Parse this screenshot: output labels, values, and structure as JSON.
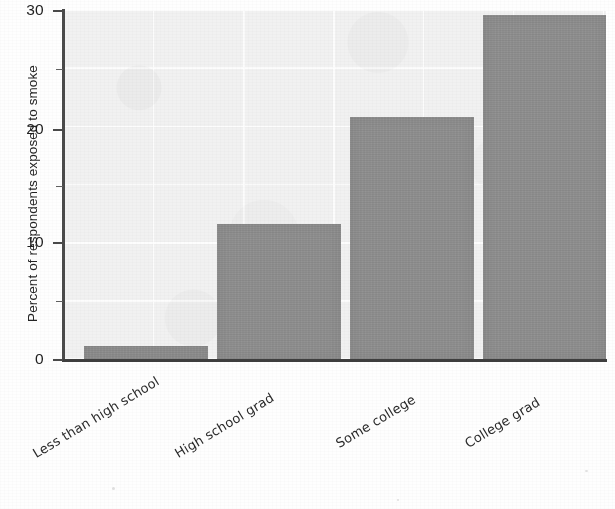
{
  "chart_data": {
    "type": "bar",
    "title": "",
    "xlabel": "",
    "ylabel": "Percent of respondents exposed to smoke",
    "categories": [
      "Less than high school",
      "High school grad",
      "Some college",
      "College grad"
    ],
    "values": [
      1.2,
      11.7,
      20.9,
      29.7
    ],
    "ylim": [
      0,
      30
    ],
    "yticks": [
      0,
      10,
      20,
      30
    ],
    "ytick_labels": [
      "0",
      "10",
      "20",
      "30"
    ],
    "minor_yticks": [
      5,
      15,
      25
    ],
    "grid": true,
    "legend": null,
    "bar_color": "#8d8d8d",
    "plot_background": "#f1f1f1",
    "axis_color": "#4a4a4a"
  },
  "figure": {
    "y_axis_title": "Percent of respondents exposed to smoke"
  }
}
